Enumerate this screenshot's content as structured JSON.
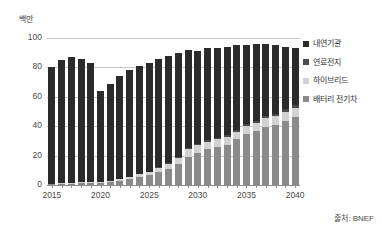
{
  "chart_data": {
    "type": "bar",
    "stacked": true,
    "title": "",
    "subtitle": "",
    "xlabel": "",
    "ylabel": "백만",
    "ylim": [
      0,
      100
    ],
    "yticks": [
      0,
      20,
      40,
      60,
      80,
      100
    ],
    "grid": true,
    "legend_position": "right",
    "x": [
      2015,
      2016,
      2017,
      2018,
      2019,
      2020,
      2021,
      2022,
      2023,
      2024,
      2025,
      2026,
      2027,
      2028,
      2029,
      2030,
      2031,
      2032,
      2033,
      2034,
      2035,
      2036,
      2037,
      2038,
      2039,
      2040
    ],
    "xtick_labels": [
      "2015",
      "2020",
      "2025",
      "2030",
      "2035",
      "2040"
    ],
    "xtick_values": [
      2015,
      2020,
      2025,
      2030,
      2035,
      2040
    ],
    "series": [
      {
        "name": "배터리 전기차",
        "color": "#8a8a8a",
        "values": [
          0.5,
          0.7,
          1.0,
          1.3,
          1.6,
          1.6,
          2.2,
          3.0,
          4.0,
          5.5,
          6.5,
          9.0,
          11.0,
          14.0,
          19.0,
          22.0,
          24.5,
          26.0,
          27.5,
          31.0,
          34.5,
          36.5,
          39.5,
          40.5,
          43.5,
          46.0
        ]
      },
      {
        "name": "하이브리드",
        "color": "#d2d2d2",
        "values": [
          0.3,
          0.4,
          0.5,
          0.6,
          0.7,
          0.6,
          0.8,
          1.0,
          1.3,
          1.8,
          2.3,
          2.8,
          3.6,
          4.6,
          5.6,
          5.0,
          5.0,
          5.0,
          5.2,
          5.4,
          5.6,
          5.8,
          6.0,
          6.2,
          6.3,
          6.4
        ]
      },
      {
        "name": "연료전지",
        "color": "#4a4a4a",
        "values": [
          0.0,
          0.0,
          0.0,
          0.0,
          0.0,
          0.0,
          0.0,
          0.1,
          0.1,
          0.2,
          0.2,
          0.3,
          0.4,
          0.5,
          0.6,
          0.7,
          0.8,
          0.9,
          1.0,
          1.2,
          1.4,
          1.5,
          1.6,
          1.7,
          1.8,
          2.0
        ]
      },
      {
        "name": "내연기관",
        "color": "#2b2b2b",
        "values": [
          79.2,
          83.9,
          85.5,
          84.1,
          80.7,
          61.8,
          66.0,
          69.9,
          72.6,
          73.5,
          74.0,
          73.9,
          72.9,
          70.9,
          66.8,
          63.3,
          62.7,
          61.1,
          60.3,
          57.4,
          54.0,
          52.2,
          48.9,
          46.6,
          42.4,
          38.6
        ]
      }
    ],
    "totals": [
      80,
      85,
      87,
      86,
      83,
      64,
      69,
      74,
      78,
      81,
      83,
      86,
      88,
      90,
      92,
      91,
      93,
      93,
      94,
      95,
      95.5,
      96,
      96,
      95,
      94,
      93
    ]
  },
  "legend": {
    "items": [
      {
        "label": "내연기관",
        "color": "#2b2b2b"
      },
      {
        "label": "연료전지",
        "color": "#4a4a4a"
      },
      {
        "label": "하이브리드",
        "color": "#d2d2d2"
      },
      {
        "label": "배터리 전기차",
        "color": "#8a8a8a"
      }
    ]
  },
  "axis": {
    "unit_title": "백만",
    "ytick_labels": [
      "100",
      "80",
      "60",
      "40",
      "20",
      "0"
    ],
    "xtick_labels": [
      "2015",
      "2020",
      "2025",
      "2030",
      "2035",
      "2040"
    ]
  },
  "footer": {
    "source": "출처: BNEF"
  },
  "colors": {
    "ice": "#2b2b2b",
    "fuelcell": "#4a4a4a",
    "hybrid": "#d2d2d2",
    "bev": "#8a8a8a",
    "grid": "#c8c8c8",
    "axis": "#8d8d8d",
    "text": "#3a3a3a"
  }
}
